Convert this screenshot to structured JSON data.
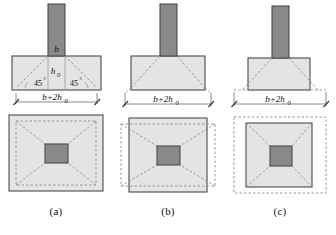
{
  "figure": {
    "type": "engineering-diagram",
    "colors": {
      "column_fill": "#8a8a8a",
      "footing_fill": "#e4e4e2",
      "outline": "#4a4a4a",
      "dashed_line": "#8e8e8e",
      "dimension_line": "#6d6d6d",
      "text": "#111111",
      "background": "#ffffff"
    },
    "panels": [
      {
        "caption": "(a)",
        "case": "cone-inside-footing",
        "elevation": {
          "column_label": "b",
          "depth_label": "h",
          "depth_label_sub": "0",
          "angle_left": "45",
          "angle_left_sup": "°",
          "angle_right": "45",
          "angle_right_sup": "°",
          "dimension_label": "b+2h",
          "dimension_label_sub": "0"
        },
        "plan": {
          "punch_perimeter_relation": "inside-footing"
        }
      },
      {
        "caption": "(b)",
        "case": "cone-meets-footing-edge",
        "elevation": {
          "column_label": "",
          "depth_label": "",
          "depth_label_sub": "",
          "angle_left": "",
          "angle_left_sup": "",
          "angle_right": "",
          "angle_right_sup": "",
          "dimension_label": "b+2h",
          "dimension_label_sub": "0"
        },
        "plan": {
          "punch_perimeter_relation": "slightly-outside-footing"
        }
      },
      {
        "caption": "(c)",
        "case": "cone-outside-footing",
        "elevation": {
          "column_label": "",
          "depth_label": "",
          "depth_label_sub": "",
          "angle_left": "",
          "angle_left_sup": "",
          "angle_right": "",
          "angle_right_sup": "",
          "dimension_label": "b+2h",
          "dimension_label_sub": "0"
        },
        "plan": {
          "punch_perimeter_relation": "well-outside-footing"
        }
      }
    ]
  },
  "footer": {
    "text": ""
  }
}
